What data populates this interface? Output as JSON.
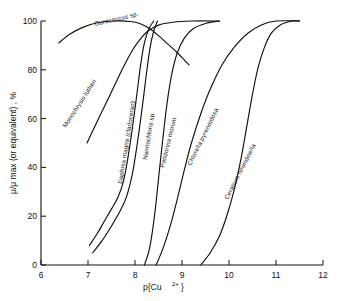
{
  "figure": {
    "title": "",
    "background_color": "#ffffff",
    "line_color": "#111111"
  },
  "axes": {
    "x": {
      "label": "p{Cu",
      "label_super": "2+",
      "label_close": "}",
      "label_full": "p{Cu 2+ }",
      "ticks": [
        "6",
        "7",
        "8",
        "9",
        "10",
        "11",
        "12"
      ],
      "min": 6,
      "max": 12
    },
    "y": {
      "label": "μ/μ max (or equivalent) , %",
      "ticks": [
        "0",
        "20",
        "40",
        "60",
        "80",
        "100"
      ],
      "min": 0,
      "max": 100
    }
  },
  "curve_labels": [
    {
      "text": "Ourococcus sp.",
      "x": 95,
      "y": 26,
      "rotate": -13
    },
    {
      "text": "Monochrysis lutheri",
      "x": 66,
      "y": 128,
      "rotate": -57
    },
    {
      "text": "Daphnia magna (cladoceran)",
      "x": 122,
      "y": 184,
      "rotate": -81
    },
    {
      "text": "Nannochloris sp.",
      "x": 147,
      "y": 160,
      "rotate": -81
    },
    {
      "text": "Pandorina morum",
      "x": 164,
      "y": 168,
      "rotate": -76
    },
    {
      "text": "Chlorella pyrenoidosa",
      "x": 191,
      "y": 166,
      "rotate": -64
    },
    {
      "text": "Ceratium hirundinella",
      "x": 228,
      "y": 200,
      "rotate": -63
    }
  ],
  "chart_data": {
    "type": "line",
    "title": "",
    "xlabel": "p{Cu 2+ }",
    "ylabel": "μ/μ max (or equivalent) , %",
    "xlim": [
      6,
      12
    ],
    "ylim": [
      0,
      100
    ],
    "grid": false,
    "legend": "inline-curve-labels",
    "series": [
      {
        "name": "Ourococcus sp.",
        "points": [
          [
            6.38,
            91
          ],
          [
            6.6,
            94.5
          ],
          [
            6.9,
            97.5
          ],
          [
            7.2,
            99.3
          ],
          [
            7.55,
            100
          ],
          [
            7.9,
            99.8
          ],
          [
            8.1,
            99
          ],
          [
            8.3,
            97
          ],
          [
            8.5,
            94
          ],
          [
            8.7,
            90.5
          ],
          [
            8.9,
            87
          ],
          [
            9.05,
            84
          ],
          [
            9.15,
            82
          ]
        ]
      },
      {
        "name": "Monochrysis lutheri",
        "points": [
          [
            6.98,
            50
          ],
          [
            7.15,
            57
          ],
          [
            7.3,
            63
          ],
          [
            7.45,
            69
          ],
          [
            7.6,
            75
          ],
          [
            7.75,
            81
          ],
          [
            7.9,
            86.5
          ],
          [
            8.05,
            91
          ],
          [
            8.25,
            95.5
          ],
          [
            8.5,
            98.3
          ],
          [
            8.8,
            99.5
          ],
          [
            9.2,
            100
          ],
          [
            9.8,
            100
          ]
        ]
      },
      {
        "name": "Daphnia magna (cladoceran)",
        "points": [
          [
            7.03,
            8
          ],
          [
            7.2,
            13
          ],
          [
            7.35,
            18
          ],
          [
            7.5,
            23
          ],
          [
            7.63,
            27.5
          ],
          [
            7.75,
            34
          ],
          [
            7.85,
            44
          ],
          [
            7.95,
            57
          ],
          [
            8.04,
            70
          ],
          [
            8.12,
            82
          ],
          [
            8.2,
            91
          ],
          [
            8.3,
            97
          ],
          [
            8.4,
            100
          ]
        ]
      },
      {
        "name": "Nannochloris sp.",
        "points": [
          [
            7.1,
            5
          ],
          [
            7.3,
            10
          ],
          [
            7.5,
            16
          ],
          [
            7.68,
            22
          ],
          [
            7.82,
            28
          ],
          [
            7.95,
            38
          ],
          [
            8.05,
            50
          ],
          [
            8.15,
            64
          ],
          [
            8.24,
            78
          ],
          [
            8.32,
            89
          ],
          [
            8.4,
            96
          ],
          [
            8.48,
            100
          ]
        ]
      },
      {
        "name": "Pandorina morum",
        "points": [
          [
            8.2,
            0
          ],
          [
            8.3,
            6
          ],
          [
            8.38,
            15
          ],
          [
            8.45,
            26
          ],
          [
            8.52,
            39
          ],
          [
            8.6,
            53
          ],
          [
            8.68,
            66
          ],
          [
            8.78,
            78
          ],
          [
            8.9,
            87
          ],
          [
            9.05,
            93
          ],
          [
            9.25,
            97
          ],
          [
            9.5,
            99
          ],
          [
            9.8,
            100
          ]
        ]
      },
      {
        "name": "Chlorella pyrenoidosa",
        "points": [
          [
            8.45,
            0
          ],
          [
            8.6,
            7
          ],
          [
            8.75,
            16
          ],
          [
            8.9,
            27
          ],
          [
            9.05,
            39
          ],
          [
            9.2,
            50
          ],
          [
            9.4,
            62
          ],
          [
            9.6,
            72
          ],
          [
            9.85,
            82
          ],
          [
            10.1,
            89
          ],
          [
            10.4,
            95
          ],
          [
            10.7,
            98.5
          ],
          [
            11.0,
            100
          ],
          [
            11.5,
            100
          ]
        ]
      },
      {
        "name": "Ceratium hirundinella",
        "points": [
          [
            9.4,
            0
          ],
          [
            9.6,
            5
          ],
          [
            9.8,
            12
          ],
          [
            9.95,
            20
          ],
          [
            10.1,
            30
          ],
          [
            10.25,
            43
          ],
          [
            10.38,
            57
          ],
          [
            10.5,
            70
          ],
          [
            10.62,
            81
          ],
          [
            10.75,
            89
          ],
          [
            10.9,
            95
          ],
          [
            11.1,
            98.5
          ],
          [
            11.35,
            100
          ],
          [
            11.5,
            100
          ]
        ]
      }
    ]
  }
}
